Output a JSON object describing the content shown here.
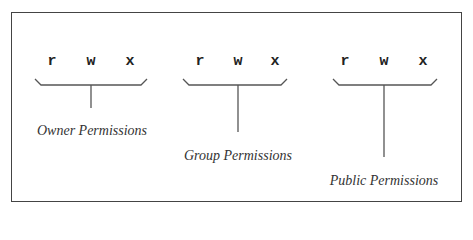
{
  "diagram": {
    "groups": [
      {
        "id": "owner",
        "letters": [
          "r",
          "w",
          "x"
        ],
        "label": "Owner Permissions"
      },
      {
        "id": "group",
        "letters": [
          "r",
          "w",
          "x"
        ],
        "label": "Group Permissions"
      },
      {
        "id": "public",
        "letters": [
          "r",
          "w",
          "x"
        ],
        "label": "Public Permissions"
      }
    ],
    "colors": {
      "line": "#555555",
      "text": "#333333",
      "frame": "#444444"
    }
  }
}
